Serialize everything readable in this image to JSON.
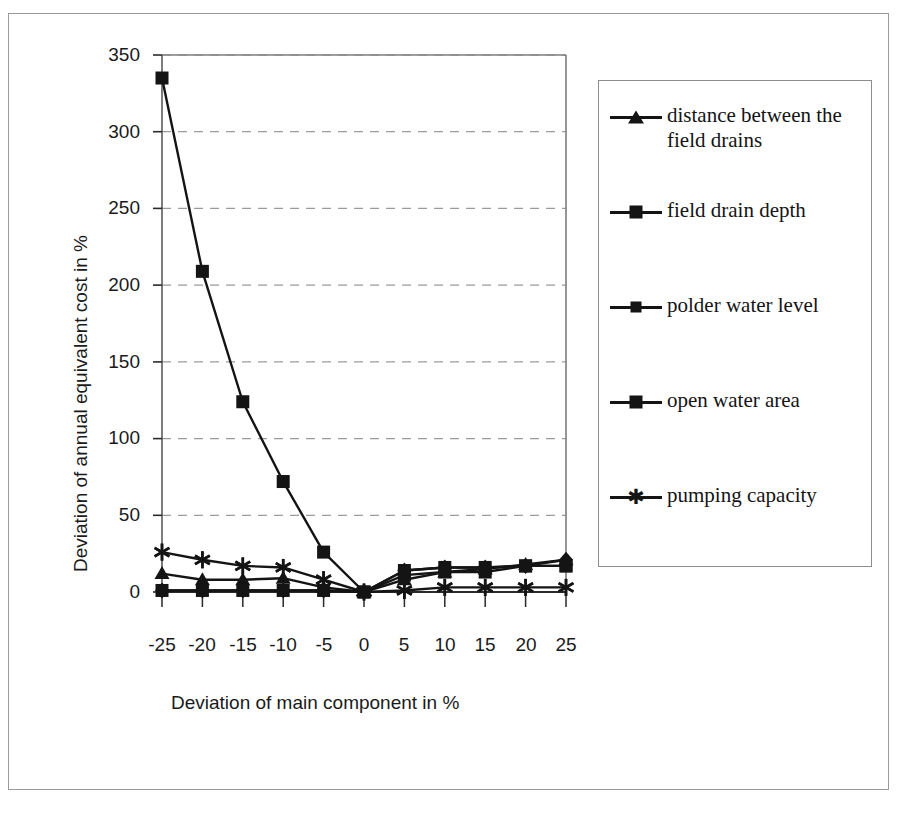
{
  "chart_data": {
    "type": "line",
    "title": "",
    "xlabel": "Deviation of main component in %",
    "ylabel": "Deviation of annual equivalent cost in %",
    "x": [
      -25,
      -20,
      -15,
      -10,
      -5,
      0,
      5,
      10,
      15,
      20,
      25
    ],
    "xtick_labels": [
      "-25",
      "-20",
      "-15",
      "-10",
      "-5",
      "0",
      "5",
      "10",
      "15",
      "20",
      "25"
    ],
    "ytick_labels": [
      "0",
      "50",
      "100",
      "150",
      "200",
      "250",
      "300",
      "350"
    ],
    "yticks": [
      0,
      50,
      100,
      150,
      200,
      250,
      300,
      350
    ],
    "ylim": [
      0,
      350
    ],
    "grid": "horizontal-dashed",
    "legend_position": "right",
    "series": [
      {
        "name": "distance between the field drains",
        "marker": "triangle",
        "values": [
          12,
          8,
          8,
          9,
          3,
          0,
          8,
          13,
          15,
          18,
          21
        ]
      },
      {
        "name": "field drain depth",
        "marker": "square",
        "values": [
          335,
          209,
          124,
          72,
          26,
          0,
          14,
          16,
          16,
          17,
          17
        ]
      },
      {
        "name": "polder water level",
        "marker": "diamond",
        "values": [
          1,
          1,
          1,
          1,
          1,
          0,
          14,
          16,
          16,
          17,
          21
        ]
      },
      {
        "name": "open water area",
        "marker": "square",
        "values": [
          1,
          1,
          1,
          1,
          1,
          0,
          11,
          13,
          13,
          17,
          17
        ]
      },
      {
        "name": "pumping capacity",
        "marker": "star",
        "values": [
          26,
          21,
          17,
          16,
          8,
          0,
          1,
          3,
          3,
          3,
          3
        ]
      }
    ]
  },
  "legend": {
    "entries": [
      {
        "label": "distance between the field drains",
        "marker": "triangle-marker"
      },
      {
        "label": "field drain depth",
        "marker": "square-marker"
      },
      {
        "label": "polder water level",
        "marker": "diamond-marker"
      },
      {
        "label": "open water area",
        "marker": "square-marker"
      },
      {
        "label": "pumping capacity",
        "marker": "star-marker"
      }
    ]
  },
  "colors": {
    "ink": "#141414",
    "grid": "#9b9b9b",
    "frame": "#6e6e6e"
  }
}
